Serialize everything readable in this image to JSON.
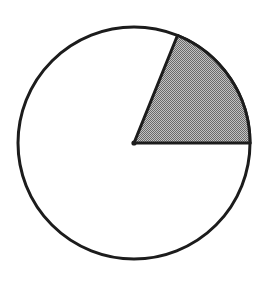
{
  "figure": {
    "title": "Circle with shaded sector",
    "background_color": "#ffffff",
    "stroke_color": "#1c1c1c",
    "stroke_width": 3,
    "fill_unshaded_color": "#ffffff",
    "fill_shaded_color": "#9a9a9a",
    "shaded_pattern": "checkerboard-dither",
    "pattern_dark_color": "#6e6e6e",
    "pattern_light_color": "#c8c8c8"
  },
  "circle": {
    "center_x": 134,
    "center_y": 143,
    "radius": 116,
    "bounds": {
      "left": 18,
      "right": 250,
      "top": 27,
      "bottom": 259
    }
  },
  "sector": {
    "label": "shaded-sector",
    "start_angle_deg": 0,
    "end_angle_deg": 68,
    "sweep_deg": 68,
    "direction": "counter-clockwise",
    "vertex_x": 134,
    "vertex_y": 143,
    "radius_end_right_x": 250,
    "radius_end_right_y": 143,
    "radius_end_upper_x": 177,
    "radius_end_upper_y": 27,
    "shaded": true
  },
  "chart_data": {
    "type": "pie",
    "title": "Circle with shaded sector",
    "categories": [
      "shaded sector",
      "unshaded remainder"
    ],
    "values": [
      68,
      292
    ],
    "units": "degrees",
    "fractions": [
      0.1889,
      0.8111
    ],
    "colors": [
      "#9a9a9a",
      "#ffffff"
    ],
    "start_angle_deg": 0,
    "rotation": "counter-clockwise from positive x-axis",
    "legend": false,
    "grid": false,
    "labels": false,
    "annotations": []
  }
}
